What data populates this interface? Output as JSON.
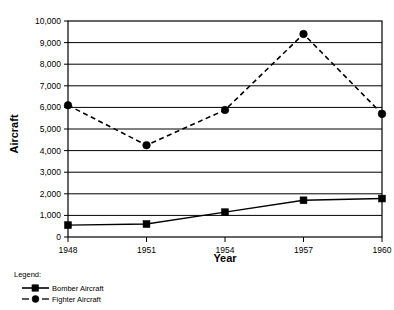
{
  "chart_data": {
    "type": "line",
    "title": "",
    "xlabel": "Year",
    "ylabel": "Aircraft",
    "categories": [
      "1948",
      "1951",
      "1954",
      "1957",
      "1960"
    ],
    "x": [
      1948,
      1951,
      1954,
      1957,
      1960
    ],
    "xlim": [
      1948,
      1960
    ],
    "ylim": [
      0,
      10000
    ],
    "yticks": [
      "0",
      "1,000",
      "2,000",
      "3,000",
      "4,000",
      "5,000",
      "6,000",
      "7,000",
      "8,000",
      "9,000",
      "10,000"
    ],
    "ytick_values": [
      0,
      1000,
      2000,
      3000,
      4000,
      5000,
      6000,
      7000,
      8000,
      9000,
      10000
    ],
    "grid": "horizontal",
    "legend_position": "below-left",
    "series": [
      {
        "name": "Bomber Aircraft",
        "values": [
          550,
          600,
          1150,
          1700,
          1780
        ],
        "line_style": "solid",
        "marker": "square",
        "color": "#000000"
      },
      {
        "name": "Fighter Aircraft",
        "values": [
          6100,
          4250,
          5880,
          9400,
          5700
        ],
        "line_style": "dashed",
        "marker": "circle",
        "color": "#000000"
      }
    ]
  },
  "legend": {
    "heading": "Legend:",
    "entries": [
      {
        "label": "Bomber Aircraft",
        "marker": "square",
        "line_style": "solid"
      },
      {
        "label": "Fighter Aircraft",
        "marker": "circle",
        "line_style": "dashed"
      }
    ]
  },
  "axis": {
    "x_title": "Year",
    "y_title": "Aircraft"
  }
}
